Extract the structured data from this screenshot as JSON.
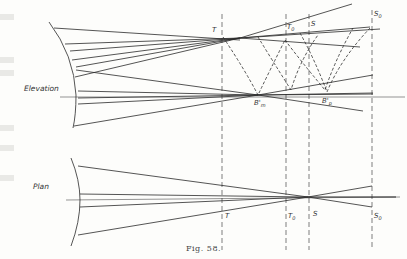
{
  "figure": {
    "caption": "Fig. 58.",
    "views": {
      "elevation": {
        "label": "Elevation"
      },
      "plan": {
        "label": "Plan"
      }
    },
    "points": {
      "T": "T",
      "T0": "T",
      "T0_sub": "0",
      "S": "S",
      "S0": "S",
      "S0_sub": "0",
      "Bm": "B'",
      "Bm_sub": "m",
      "Bp": "B'",
      "Bp_sub": "p",
      "T_plan": "T",
      "T0_plan": "T",
      "T0_plan_sub": "0",
      "S_plan": "S",
      "S0_plan": "S",
      "S0_plan_sub": "0"
    },
    "colors": {
      "ink": "#2a2a2a",
      "paper": "#fdfdfb"
    }
  }
}
